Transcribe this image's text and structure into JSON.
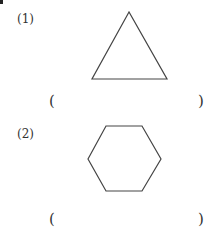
{
  "questions": [
    {
      "number": "(1)",
      "shape": "triangle",
      "answer_open": "(",
      "answer_close": ")",
      "answer": ""
    },
    {
      "number": "(2)",
      "shape": "hexagon",
      "answer_open": "(",
      "answer_close": ")",
      "answer": ""
    }
  ],
  "colors": {
    "stroke": "#444444",
    "text": "#333333"
  }
}
